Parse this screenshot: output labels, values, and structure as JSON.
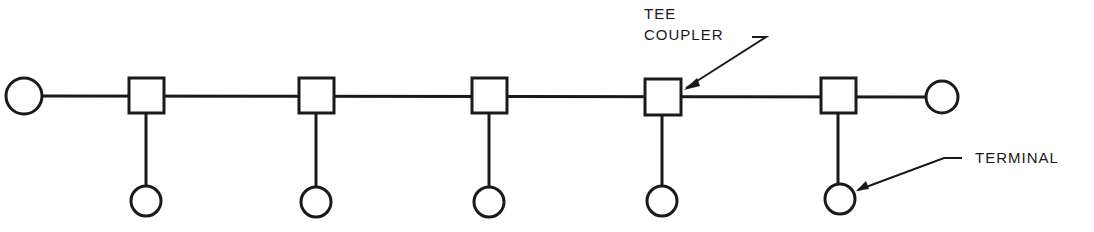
{
  "diagram": {
    "type": "bus network topology",
    "labels": {
      "tee_coupler_line1": "TEE",
      "tee_coupler_line2": "COUPLER",
      "terminal": "TERMINAL"
    },
    "colors": {
      "stroke": "#1a1a1a",
      "background": "#ffffff"
    },
    "bus": {
      "end_terminators": 2,
      "tee_couplers": 5,
      "terminals": 5
    }
  }
}
